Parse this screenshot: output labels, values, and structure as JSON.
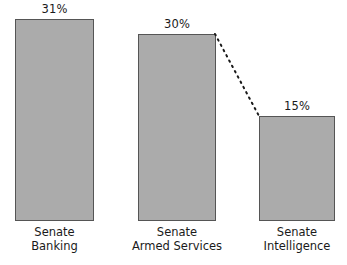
{
  "chart_data": {
    "type": "bar",
    "title": "",
    "subtitle": "",
    "xlabel": "",
    "ylabel": "",
    "grid": false,
    "legend": null,
    "ylim": [
      0,
      35
    ],
    "categories": [
      "Senate Banking",
      "Senate Armed Services",
      "Senate Intelligence"
    ],
    "category_lines": [
      [
        "Senate",
        "Banking"
      ],
      [
        "Senate",
        "Armed Services"
      ],
      [
        "Senate",
        "Intelligence"
      ]
    ],
    "values": [
      31,
      30,
      15
    ],
    "data_labels": [
      "31%",
      "30%",
      "15%"
    ],
    "annotations": [
      {
        "type": "connector",
        "style": "dotted",
        "from_category": "Senate Armed Services",
        "to_category": "Senate Intelligence",
        "from_point": [
          215,
          34
        ],
        "to_point": [
          259,
          116
        ]
      }
    ],
    "colors": {
      "bar_fill": "#ababab",
      "bar_stroke": "#555555",
      "text": "#1a1a1a",
      "connector": "#1a1a1a",
      "background": "#ffffff"
    }
  },
  "bars": [
    {
      "label": "31%",
      "line1": "Senate",
      "line2": "Banking",
      "left": 15,
      "top": 19,
      "width": 79,
      "height": 202
    },
    {
      "label": "30%",
      "line1": "Senate",
      "line2": "Armed Services",
      "left": 138,
      "top": 34,
      "width": 78,
      "height": 187
    },
    {
      "label": "15%",
      "line1": "Senate",
      "line2": "Intelligence",
      "left": 259,
      "top": 116,
      "width": 76,
      "height": 105
    }
  ]
}
